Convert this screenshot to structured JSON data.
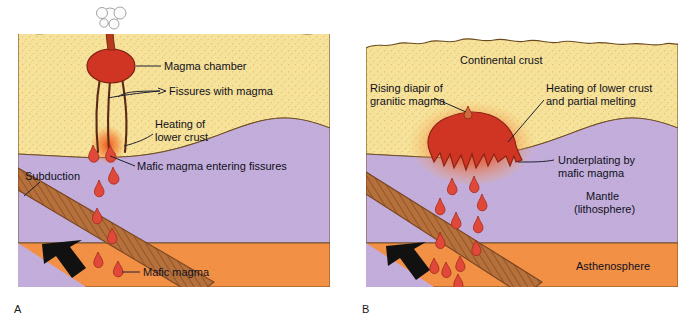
{
  "figure": {
    "background_color": "#ffffff"
  },
  "palette": {
    "continental_crust": "#f6e29a",
    "crust_speckle": "#e8c96a",
    "mantle_lithosphere": "#c3aedb",
    "asthenosphere": "#f29046",
    "magma_red": "#d8382a",
    "magma_droplet": "#e0483a",
    "heating_glow": "#f2622a",
    "subducting_slab": "#b5703c",
    "slab_hatch": "#8a4f24",
    "arrow_black": "#111111",
    "outline": "#3a2a1a",
    "label_text": "#101020",
    "leader_line": "#202030"
  },
  "panels": [
    {
      "id": "A",
      "letter": "A",
      "labels": [
        {
          "name": "magma-chamber",
          "text": "Magma chamber"
        },
        {
          "name": "fissures-with-magma",
          "text": "Fissures with magma"
        },
        {
          "name": "heating-of-lower-crust",
          "lines": [
            "Heating of",
            "lower crust"
          ]
        },
        {
          "name": "mafic-magma-entering-fissures",
          "text": "Mafic magma entering fissures"
        },
        {
          "name": "subduction",
          "text": "Subduction"
        },
        {
          "name": "mafic-magma",
          "text": "Mafic magma"
        }
      ],
      "features": [
        "volcano-vent",
        "eruption-cloud",
        "magma-chamber-blob",
        "three-fissure-conduits",
        "heating-glow-patch",
        "magma-droplets",
        "subducting-slab",
        "subduction-arrow"
      ]
    },
    {
      "id": "B",
      "letter": "B",
      "labels": [
        {
          "name": "continental-crust",
          "text": "Continental crust"
        },
        {
          "name": "rising-diapir",
          "lines": [
            "Rising diapir of",
            "granitic magma"
          ]
        },
        {
          "name": "heating-partial-melting",
          "lines": [
            "Heating of lower crust",
            "and partial melting"
          ]
        },
        {
          "name": "underplating",
          "lines": [
            "Underplating by",
            "mafic magma"
          ]
        },
        {
          "name": "mantle-lithosphere",
          "lines": [
            "Mantle",
            "(lithosphere)"
          ]
        },
        {
          "name": "asthenosphere",
          "text": "Asthenosphere"
        }
      ],
      "features": [
        "granitic-diapir-blob",
        "heating-glow-halo",
        "small-rising-diapir-droplet",
        "underplating-drips",
        "magma-droplets",
        "subducting-slab",
        "subduction-arrow"
      ]
    }
  ],
  "layers": {
    "continental_crust_label": "Continental crust",
    "mantle_label_line1": "Mantle",
    "mantle_label_line2": "(lithosphere)",
    "asthenosphere_label": "Asthenosphere"
  },
  "labels_a": {
    "magma_chamber": "Magma chamber",
    "fissures_with_magma": "Fissures with magma",
    "heating_line1": "Heating of",
    "heating_line2": "lower crust",
    "mafic_entering": "Mafic magma entering fissures",
    "subduction": "Subduction",
    "mafic_magma": "Mafic magma",
    "letter": "A"
  },
  "labels_b": {
    "continental_crust": "Continental crust",
    "diapir_line1": "Rising diapir of",
    "diapir_line2": "granitic magma",
    "heating_line1": "Heating of lower crust",
    "heating_line2": "and partial melting",
    "underplating_line1": "Underplating by",
    "underplating_line2": "mafic magma",
    "mantle_line1": "Mantle",
    "mantle_line2": "(lithosphere)",
    "asthenosphere": "Asthenosphere",
    "letter": "B"
  }
}
